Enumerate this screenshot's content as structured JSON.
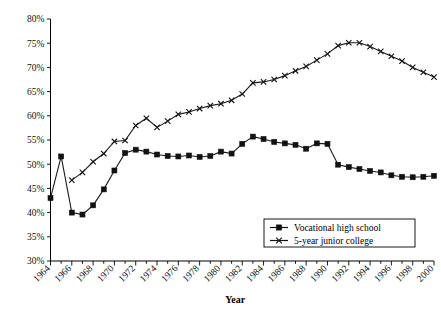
{
  "chart_data": {
    "type": "line",
    "title": "",
    "xlabel": "Year",
    "ylabel": "",
    "xlim": [
      1964,
      2000
    ],
    "ylim": [
      30,
      80
    ],
    "ytick_labels": [
      "30%",
      "35%",
      "40%",
      "45%",
      "50%",
      "55%",
      "60%",
      "65%",
      "70%",
      "75%",
      "80%"
    ],
    "ytick_values": [
      30,
      35,
      40,
      45,
      50,
      55,
      60,
      65,
      70,
      75,
      80
    ],
    "xtick_labels": [
      "1964",
      "1966",
      "1968",
      "1970",
      "1972",
      "1974",
      "1976",
      "1978",
      "1980",
      "1982",
      "1984",
      "1986",
      "1988",
      "1990",
      "1992",
      "1994",
      "1996",
      "1998",
      "2000"
    ],
    "xtick_values": [
      1964,
      1966,
      1968,
      1970,
      1972,
      1974,
      1976,
      1978,
      1980,
      1982,
      1984,
      1986,
      1988,
      1990,
      1992,
      1994,
      1996,
      1998,
      2000
    ],
    "grid": false,
    "legend_position": "bottom-right",
    "series": [
      {
        "name": "Vocational high school",
        "marker": "square",
        "x": [
          1964,
          1965,
          1966,
          1967,
          1968,
          1969,
          1970,
          1971,
          1972,
          1973,
          1974,
          1975,
          1976,
          1977,
          1978,
          1979,
          1980,
          1981,
          1982,
          1983,
          1984,
          1985,
          1986,
          1987,
          1988,
          1989,
          1990,
          1991,
          1992,
          1993,
          1994,
          1995,
          1996,
          1997,
          1998,
          1999,
          2000
        ],
        "values": [
          43.0,
          51.6,
          40.0,
          39.6,
          41.5,
          44.8,
          48.7,
          52.3,
          53.0,
          52.6,
          52.0,
          51.7,
          51.6,
          51.8,
          51.5,
          51.7,
          52.6,
          52.2,
          54.2,
          55.7,
          55.2,
          54.6,
          54.3,
          54.0,
          53.2,
          54.3,
          54.2,
          49.9,
          49.4,
          49.0,
          48.6,
          48.3,
          47.7,
          47.4,
          47.3,
          47.4,
          47.6
        ]
      },
      {
        "name": "5-year junior college",
        "marker": "cross",
        "x": [
          1966,
          1967,
          1968,
          1969,
          1970,
          1971,
          1972,
          1973,
          1974,
          1975,
          1976,
          1977,
          1978,
          1979,
          1980,
          1981,
          1982,
          1983,
          1984,
          1985,
          1986,
          1987,
          1988,
          1989,
          1990,
          1991,
          1992,
          1993,
          1994,
          1995,
          1996,
          1997,
          1998,
          1999,
          2000
        ],
        "values": [
          46.7,
          48.3,
          50.5,
          52.2,
          54.7,
          54.9,
          58.0,
          59.5,
          57.6,
          58.9,
          60.3,
          60.8,
          61.5,
          62.1,
          62.5,
          63.2,
          64.5,
          66.8,
          67.0,
          67.5,
          68.3,
          69.3,
          70.2,
          71.5,
          72.8,
          74.5,
          75.1,
          75.1,
          74.3,
          73.3,
          72.3,
          71.3,
          70.0,
          69.0,
          68.0
        ]
      }
    ]
  },
  "legend": {
    "items": [
      {
        "label": "Vocational high school"
      },
      {
        "label": "5-year junior college"
      }
    ]
  }
}
